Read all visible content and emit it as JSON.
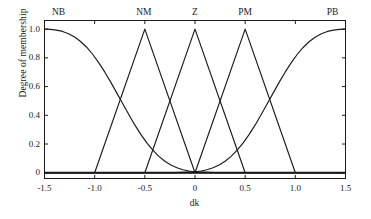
{
  "chart_data": {
    "type": "line",
    "title": "",
    "xlabel": "dk",
    "ylabel": "Degree of membership",
    "xlim": [
      -1.5,
      1.5
    ],
    "ylim": [
      -0.04,
      1.06
    ],
    "grid": false,
    "legend_position": "in-plot-top",
    "xticks": [
      "-1.5",
      "-1.0",
      "-0.5",
      "0",
      "0.5",
      "1.0",
      "1.5"
    ],
    "xtick_values": [
      -1.5,
      -1.0,
      -0.5,
      0,
      0.5,
      1.0,
      1.5
    ],
    "yticks": [
      "0",
      "0.2",
      "0.4",
      "0.6",
      "0.8",
      "1.0"
    ],
    "ytick_values": [
      0,
      0.2,
      0.4,
      0.6,
      0.8,
      1.0
    ],
    "line_color": "#1a1a1a",
    "axis_color": "#1a1a1a",
    "series": [
      {
        "name": "NB",
        "shape": "gaussian-shoulder-left",
        "label_x": -1.36,
        "label_y": 1.12,
        "points": [
          [
            -1.5,
            1.0
          ],
          [
            -1.44,
            0.998
          ],
          [
            -1.38,
            0.993
          ],
          [
            -1.32,
            0.984
          ],
          [
            -1.26,
            0.968
          ],
          [
            -1.2,
            0.945
          ],
          [
            -1.14,
            0.914
          ],
          [
            -1.08,
            0.874
          ],
          [
            -1.02,
            0.825
          ],
          [
            -0.96,
            0.767
          ],
          [
            -0.9,
            0.702
          ],
          [
            -0.84,
            0.631
          ],
          [
            -0.78,
            0.556
          ],
          [
            -0.72,
            0.48
          ],
          [
            -0.66,
            0.405
          ],
          [
            -0.6,
            0.333
          ],
          [
            -0.54,
            0.267
          ],
          [
            -0.48,
            0.208
          ],
          [
            -0.42,
            0.157
          ],
          [
            -0.36,
            0.114
          ],
          [
            -0.3,
            0.08
          ],
          [
            -0.24,
            0.054
          ],
          [
            -0.18,
            0.035
          ],
          [
            -0.12,
            0.021
          ],
          [
            -0.06,
            0.012
          ],
          [
            0.0,
            0.007
          ],
          [
            0.2,
            0.001
          ],
          [
            0.6,
            0.0
          ],
          [
            1.0,
            0.0
          ],
          [
            1.5,
            0.0
          ]
        ]
      },
      {
        "name": "NM",
        "shape": "triangle",
        "label_x": -0.51,
        "label_y": 1.12,
        "points": [
          [
            -1.5,
            0.0
          ],
          [
            -1.0,
            0.0
          ],
          [
            -0.5,
            1.0
          ],
          [
            0.0,
            0.0
          ],
          [
            1.5,
            0.0
          ]
        ]
      },
      {
        "name": "Z",
        "shape": "triangle",
        "label_x": 0.0,
        "label_y": 1.12,
        "points": [
          [
            -1.5,
            0.0
          ],
          [
            -0.5,
            0.0
          ],
          [
            0.0,
            1.0
          ],
          [
            0.5,
            0.0
          ],
          [
            1.5,
            0.0
          ]
        ]
      },
      {
        "name": "PM",
        "shape": "triangle",
        "label_x": 0.5,
        "label_y": 1.12,
        "points": [
          [
            -1.5,
            0.0
          ],
          [
            0.0,
            0.0
          ],
          [
            0.5,
            1.0
          ],
          [
            1.0,
            0.0
          ],
          [
            1.5,
            0.0
          ]
        ]
      },
      {
        "name": "PB",
        "shape": "gaussian-shoulder-right",
        "label_x": 1.37,
        "label_y": 1.12,
        "points": [
          [
            -1.5,
            0.0
          ],
          [
            -1.0,
            0.0
          ],
          [
            -0.6,
            0.0
          ],
          [
            -0.2,
            0.001
          ],
          [
            0.0,
            0.007
          ],
          [
            0.06,
            0.012
          ],
          [
            0.12,
            0.021
          ],
          [
            0.18,
            0.035
          ],
          [
            0.24,
            0.054
          ],
          [
            0.3,
            0.08
          ],
          [
            0.36,
            0.114
          ],
          [
            0.42,
            0.157
          ],
          [
            0.48,
            0.208
          ],
          [
            0.54,
            0.267
          ],
          [
            0.6,
            0.333
          ],
          [
            0.66,
            0.405
          ],
          [
            0.72,
            0.48
          ],
          [
            0.78,
            0.556
          ],
          [
            0.84,
            0.631
          ],
          [
            0.9,
            0.702
          ],
          [
            0.96,
            0.767
          ],
          [
            1.02,
            0.825
          ],
          [
            1.08,
            0.874
          ],
          [
            1.14,
            0.914
          ],
          [
            1.2,
            0.945
          ],
          [
            1.26,
            0.968
          ],
          [
            1.32,
            0.984
          ],
          [
            1.38,
            0.993
          ],
          [
            1.44,
            0.998
          ],
          [
            1.5,
            1.0
          ]
        ]
      }
    ],
    "baseline": {
      "y": 0,
      "emphasized": true
    }
  }
}
